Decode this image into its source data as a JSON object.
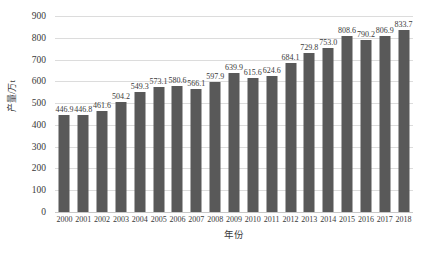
{
  "chart_data": {
    "type": "bar",
    "title": "",
    "xlabel": "年份",
    "ylabel": "产量/万t",
    "ylim": [
      0,
      900
    ],
    "yticks": [
      "0",
      "100",
      "200",
      "300",
      "400",
      "500",
      "600",
      "700",
      "800",
      "900"
    ],
    "grid": "horizontal",
    "legend": "none",
    "bar_color": "#595959",
    "gridline_color": "#dcdcdc",
    "categories": [
      "2000",
      "2001",
      "2002",
      "2003",
      "2004",
      "2005",
      "2006",
      "2007",
      "2008",
      "2009",
      "2010",
      "2011",
      "2012",
      "2013",
      "2014",
      "2015",
      "2016",
      "2017",
      "2018"
    ],
    "values": [
      446.9,
      446.8,
      461.6,
      504.2,
      549.3,
      573.1,
      580.6,
      566.1,
      597.9,
      639.9,
      615.6,
      624.6,
      684.1,
      729.8,
      753.0,
      808.6,
      790.2,
      806.9,
      833.7
    ],
    "data_labels": [
      "446.9",
      "446.8",
      "461.6",
      "504.2",
      "549.3",
      "573.1",
      "580.6",
      "566.1",
      "597.9",
      "639.9",
      "615.6",
      "624.6",
      "684.1",
      "729.8",
      "753.0",
      "808.6",
      "790.2",
      "806.9",
      "833.7"
    ]
  }
}
